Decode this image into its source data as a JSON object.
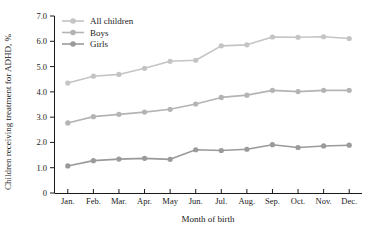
{
  "chart_data": {
    "type": "line",
    "title": "",
    "xlabel": "Month of birth",
    "ylabel": "Children receiving treatment for ADHD, %",
    "categories": [
      "Jan.",
      "Feb.",
      "Mar.",
      "Apr.",
      "May",
      "Jun.",
      "Jul.",
      "Aug.",
      "Sep.",
      "Oct.",
      "Nov.",
      "Dec."
    ],
    "yticks": [
      "0",
      "1.0",
      "2.0",
      "3.0",
      "4.0",
      "5.0",
      "6.0",
      "7.0"
    ],
    "ytick_values": [
      0,
      1.0,
      2.0,
      3.0,
      4.0,
      5.0,
      6.0,
      7.0
    ],
    "ylim": [
      0,
      7.0
    ],
    "grid": false,
    "legend_position": "top-left",
    "series": [
      {
        "name": "All children",
        "color": "#c4c4c4",
        "values": [
          4.35,
          4.62,
          4.69,
          4.93,
          5.21,
          5.25,
          5.82,
          5.86,
          6.17,
          6.16,
          6.18,
          6.11
        ]
      },
      {
        "name": "Boys",
        "color": "#b4b4b4",
        "values": [
          2.77,
          3.02,
          3.11,
          3.2,
          3.31,
          3.52,
          3.78,
          3.87,
          4.06,
          4.01,
          4.06,
          4.06
        ]
      },
      {
        "name": "Girls",
        "color": "#9a9a9a",
        "values": [
          1.07,
          1.28,
          1.34,
          1.37,
          1.33,
          1.71,
          1.68,
          1.73,
          1.91,
          1.8,
          1.86,
          1.89
        ]
      }
    ]
  },
  "colors": {
    "axis": "#1a1a1a",
    "background": "#ffffff",
    "all_children": "#c4c4c4",
    "boys": "#b4b4b4",
    "girls": "#9a9a9a"
  }
}
